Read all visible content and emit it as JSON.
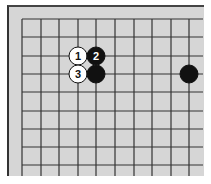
{
  "diagram": {
    "type": "go-board-fragment",
    "board_color": "#d6d6d6",
    "line_color": "#333333",
    "grid": {
      "x_lines": [
        22,
        41,
        59,
        78,
        96,
        115,
        134,
        152,
        171,
        189
      ],
      "y_lines": [
        19,
        37,
        56,
        74,
        92,
        111,
        129,
        147,
        165
      ],
      "x_extent": [
        22,
        203
      ],
      "y_extent": [
        19,
        176
      ]
    },
    "stones": [
      {
        "color": "white",
        "col": 3,
        "row": 2,
        "label": "1"
      },
      {
        "color": "black",
        "col": 4,
        "row": 2,
        "label": "2"
      },
      {
        "color": "white",
        "col": 3,
        "row": 3,
        "label": "3"
      },
      {
        "color": "black",
        "col": 4,
        "row": 3,
        "label": ""
      },
      {
        "color": "black",
        "col": 9,
        "row": 3,
        "label": ""
      }
    ],
    "stone_radius": 9
  }
}
